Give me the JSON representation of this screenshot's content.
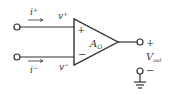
{
  "diagram": {
    "colors": {
      "stroke": "#333333",
      "background": "#ffffff"
    },
    "inputs": {
      "noninverting": {
        "current_label": "i",
        "current_sup": "+",
        "voltage_label": "v",
        "voltage_sup": "+"
      },
      "inverting": {
        "current_label": "i",
        "current_sup": "−",
        "voltage_label": "v",
        "voltage_sup": "−"
      }
    },
    "amplifier": {
      "gain_label": "A",
      "gain_sub": "O",
      "plus_sign": "+",
      "minus_sign": "−"
    },
    "output": {
      "voltage_label": "V",
      "voltage_sub": "out",
      "plus_sign": "+",
      "minus_sign": "−"
    }
  }
}
